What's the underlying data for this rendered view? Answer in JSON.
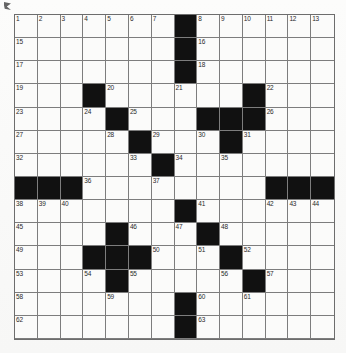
{
  "puzzle": {
    "type": "crossword-grid",
    "rows": 14,
    "cols": 14,
    "colors": {
      "block": "#111111",
      "cell": "#fbfbfa",
      "grid_line": "#7d7d7d",
      "number_text": "#2a2a2a",
      "page_background": "#fcfcfb"
    },
    "grid": [
      [
        {
          "number": "1",
          "block": false
        },
        {
          "number": "2",
          "block": false
        },
        {
          "number": "3",
          "block": false
        },
        {
          "number": "4",
          "block": false
        },
        {
          "number": "5",
          "block": false
        },
        {
          "number": "6",
          "block": false
        },
        {
          "number": "7",
          "block": false
        },
        {
          "number": "",
          "block": true
        },
        {
          "number": "8",
          "block": false
        },
        {
          "number": "9",
          "block": false
        },
        {
          "number": "10",
          "block": false
        },
        {
          "number": "11",
          "block": false
        },
        {
          "number": "12",
          "block": false
        },
        {
          "number": "13",
          "block": false
        }
      ],
      [
        {
          "number": "15",
          "block": false
        },
        {
          "number": "",
          "block": false
        },
        {
          "number": "",
          "block": false
        },
        {
          "number": "",
          "block": false
        },
        {
          "number": "",
          "block": false
        },
        {
          "number": "",
          "block": false
        },
        {
          "number": "",
          "block": false
        },
        {
          "number": "",
          "block": true
        },
        {
          "number": "16",
          "block": false
        },
        {
          "number": "",
          "block": false
        },
        {
          "number": "",
          "block": false
        },
        {
          "number": "",
          "block": false
        },
        {
          "number": "",
          "block": false
        },
        {
          "number": "",
          "block": false
        }
      ],
      [
        {
          "number": "17",
          "block": false
        },
        {
          "number": "",
          "block": false
        },
        {
          "number": "",
          "block": false
        },
        {
          "number": "",
          "block": false
        },
        {
          "number": "",
          "block": false
        },
        {
          "number": "",
          "block": false
        },
        {
          "number": "",
          "block": false
        },
        {
          "number": "",
          "block": true
        },
        {
          "number": "18",
          "block": false
        },
        {
          "number": "",
          "block": false
        },
        {
          "number": "",
          "block": false
        },
        {
          "number": "",
          "block": false
        },
        {
          "number": "",
          "block": false
        },
        {
          "number": "",
          "block": false
        }
      ],
      [
        {
          "number": "19",
          "block": false
        },
        {
          "number": "",
          "block": false
        },
        {
          "number": "",
          "block": false
        },
        {
          "number": "",
          "block": true
        },
        {
          "number": "20",
          "block": false
        },
        {
          "number": "",
          "block": false
        },
        {
          "number": "",
          "block": false
        },
        {
          "number": "21",
          "block": false
        },
        {
          "number": "",
          "block": false
        },
        {
          "number": "",
          "block": false
        },
        {
          "number": "",
          "block": true
        },
        {
          "number": "22",
          "block": false
        },
        {
          "number": "",
          "block": false
        },
        {
          "number": "",
          "block": false
        }
      ],
      [
        {
          "number": "23",
          "block": false
        },
        {
          "number": "",
          "block": false
        },
        {
          "number": "",
          "block": false
        },
        {
          "number": "24",
          "block": false
        },
        {
          "number": "",
          "block": true
        },
        {
          "number": "25",
          "block": false
        },
        {
          "number": "",
          "block": false
        },
        {
          "number": "",
          "block": false
        },
        {
          "number": "",
          "block": true
        },
        {
          "number": "",
          "block": true
        },
        {
          "number": "",
          "block": true
        },
        {
          "number": "26",
          "block": false
        },
        {
          "number": "",
          "block": false
        },
        {
          "number": "",
          "block": false
        }
      ],
      [
        {
          "number": "27",
          "block": false
        },
        {
          "number": "",
          "block": false
        },
        {
          "number": "",
          "block": false
        },
        {
          "number": "",
          "block": false
        },
        {
          "number": "28",
          "block": false
        },
        {
          "number": "",
          "block": true
        },
        {
          "number": "29",
          "block": false
        },
        {
          "number": "",
          "block": false
        },
        {
          "number": "30",
          "block": false
        },
        {
          "number": "",
          "block": true
        },
        {
          "number": "31",
          "block": false
        },
        {
          "number": "",
          "block": false
        },
        {
          "number": "",
          "block": false
        },
        {
          "number": "",
          "block": false
        }
      ],
      [
        {
          "number": "32",
          "block": false
        },
        {
          "number": "",
          "block": false
        },
        {
          "number": "",
          "block": false
        },
        {
          "number": "",
          "block": false
        },
        {
          "number": "",
          "block": false
        },
        {
          "number": "33",
          "block": false
        },
        {
          "number": "",
          "block": true
        },
        {
          "number": "34",
          "block": false
        },
        {
          "number": "",
          "block": false
        },
        {
          "number": "35",
          "block": false
        },
        {
          "number": "",
          "block": false
        },
        {
          "number": "",
          "block": false
        },
        {
          "number": "",
          "block": false
        },
        {
          "number": "",
          "block": false
        }
      ],
      [
        {
          "number": "",
          "block": true
        },
        {
          "number": "",
          "block": true
        },
        {
          "number": "",
          "block": true
        },
        {
          "number": "36",
          "block": false
        },
        {
          "number": "",
          "block": false
        },
        {
          "number": "",
          "block": false
        },
        {
          "number": "37",
          "block": false
        },
        {
          "number": "",
          "block": false
        },
        {
          "number": "",
          "block": false
        },
        {
          "number": "",
          "block": false
        },
        {
          "number": "",
          "block": false
        },
        {
          "number": "",
          "block": true
        },
        {
          "number": "",
          "block": true
        },
        {
          "number": "",
          "block": true
        }
      ],
      [
        {
          "number": "38",
          "block": false
        },
        {
          "number": "39",
          "block": false
        },
        {
          "number": "40",
          "block": false
        },
        {
          "number": "",
          "block": false
        },
        {
          "number": "",
          "block": false
        },
        {
          "number": "",
          "block": false
        },
        {
          "number": "",
          "block": false
        },
        {
          "number": "",
          "block": true
        },
        {
          "number": "41",
          "block": false
        },
        {
          "number": "",
          "block": false
        },
        {
          "number": "",
          "block": false
        },
        {
          "number": "42",
          "block": false
        },
        {
          "number": "43",
          "block": false
        },
        {
          "number": "44",
          "block": false
        }
      ],
      [
        {
          "number": "45",
          "block": false
        },
        {
          "number": "",
          "block": false
        },
        {
          "number": "",
          "block": false
        },
        {
          "number": "",
          "block": false
        },
        {
          "number": "",
          "block": true
        },
        {
          "number": "46",
          "block": false
        },
        {
          "number": "",
          "block": false
        },
        {
          "number": "47",
          "block": false
        },
        {
          "number": "",
          "block": true
        },
        {
          "number": "48",
          "block": false
        },
        {
          "number": "",
          "block": false
        },
        {
          "number": "",
          "block": false
        },
        {
          "number": "",
          "block": false
        },
        {
          "number": "",
          "block": false
        }
      ],
      [
        {
          "number": "49",
          "block": false
        },
        {
          "number": "",
          "block": false
        },
        {
          "number": "",
          "block": false
        },
        {
          "number": "",
          "block": true
        },
        {
          "number": "",
          "block": true
        },
        {
          "number": "",
          "block": true
        },
        {
          "number": "50",
          "block": false
        },
        {
          "number": "",
          "block": false
        },
        {
          "number": "51",
          "block": false
        },
        {
          "number": "",
          "block": true
        },
        {
          "number": "52",
          "block": false
        },
        {
          "number": "",
          "block": false
        },
        {
          "number": "",
          "block": false
        },
        {
          "number": "",
          "block": false
        }
      ],
      [
        {
          "number": "53",
          "block": false
        },
        {
          "number": "",
          "block": false
        },
        {
          "number": "",
          "block": false
        },
        {
          "number": "54",
          "block": false
        },
        {
          "number": "",
          "block": true
        },
        {
          "number": "55",
          "block": false
        },
        {
          "number": "",
          "block": false
        },
        {
          "number": "",
          "block": false
        },
        {
          "number": "",
          "block": false
        },
        {
          "number": "56",
          "block": false
        },
        {
          "number": "",
          "block": true
        },
        {
          "number": "57",
          "block": false
        },
        {
          "number": "",
          "block": false
        },
        {
          "number": "",
          "block": false
        }
      ],
      [
        {
          "number": "58",
          "block": false
        },
        {
          "number": "",
          "block": false
        },
        {
          "number": "",
          "block": false
        },
        {
          "number": "",
          "block": false
        },
        {
          "number": "59",
          "block": false
        },
        {
          "number": "",
          "block": false
        },
        {
          "number": "",
          "block": false
        },
        {
          "number": "",
          "block": true
        },
        {
          "number": "60",
          "block": false
        },
        {
          "number": "",
          "block": false
        },
        {
          "number": "61",
          "block": false
        },
        {
          "number": "",
          "block": false
        },
        {
          "number": "",
          "block": false
        },
        {
          "number": "",
          "block": false
        }
      ],
      [
        {
          "number": "62",
          "block": false
        },
        {
          "number": "",
          "block": false
        },
        {
          "number": "",
          "block": false
        },
        {
          "number": "",
          "block": false
        },
        {
          "number": "",
          "block": false
        },
        {
          "number": "",
          "block": false
        },
        {
          "number": "",
          "block": false
        },
        {
          "number": "",
          "block": true
        },
        {
          "number": "63",
          "block": false
        },
        {
          "number": "",
          "block": false
        },
        {
          "number": "",
          "block": false
        },
        {
          "number": "",
          "block": false
        },
        {
          "number": "",
          "block": false
        },
        {
          "number": "",
          "block": false
        }
      ],
      [
        {
          "number": "64",
          "block": false
        },
        {
          "number": "",
          "block": false
        },
        {
          "number": "",
          "block": false
        },
        {
          "number": "",
          "block": false
        },
        {
          "number": "",
          "block": false
        },
        {
          "number": "",
          "block": false
        },
        {
          "number": "",
          "block": false
        },
        {
          "number": "",
          "block": true
        },
        {
          "number": "65",
          "block": false
        },
        {
          "number": "",
          "block": false
        },
        {
          "number": "",
          "block": false
        },
        {
          "number": "",
          "block": false
        },
        {
          "number": "",
          "block": false
        },
        {
          "number": "",
          "block": false
        }
      ]
    ]
  }
}
